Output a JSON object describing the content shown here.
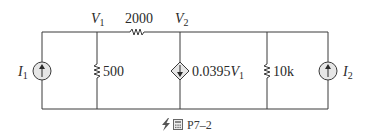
{
  "figure": {
    "caption": "P7–2",
    "caption_icons": [
      "lightning-icon",
      "calculator-icon"
    ]
  },
  "nodes": {
    "v1": {
      "symbol": "V",
      "subscript": "1"
    },
    "v2": {
      "symbol": "V",
      "subscript": "2"
    }
  },
  "components": {
    "series_resistor": {
      "value": "2000"
    },
    "shunt_resistor_1": {
      "value": "500"
    },
    "dependent_source": {
      "coefficient": "0.0395",
      "symbol": "V",
      "subscript": "1"
    },
    "shunt_resistor_2": {
      "value": "10k"
    },
    "source_i1": {
      "symbol": "I",
      "subscript": "1"
    },
    "source_i2": {
      "symbol": "I",
      "subscript": "2"
    }
  },
  "colors": {
    "wire": "#3a3a3a",
    "source_fill": "#e6e6e6",
    "text": "#2a2a2a"
  }
}
